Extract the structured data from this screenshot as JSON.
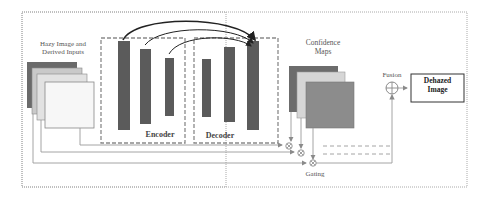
{
  "diagram": {
    "nodes": {
      "inputs_label_line1": "Hazy Image and",
      "inputs_label_line2": "Derived Inputs",
      "encoder_label": "Encoder",
      "decoder_label": "Decoder",
      "confidence_line1": "Confidence",
      "confidence_line2": "Maps",
      "fusion_label": "Fusion",
      "output_line1": "Dehazed",
      "output_line2": "Image",
      "gating_label": "Gating"
    },
    "icons": {
      "fusion": "circle-plus-icon",
      "gating": "circle-times-icon"
    },
    "colors": {
      "bar": "#5b5b5b",
      "line": "#9a9a9a",
      "dashed_box": "#8a8a8a",
      "input_layer_1": "#6a6a6a",
      "input_layer_2": "#c9c9c9",
      "input_layer_3": "#e2e2e2",
      "input_layer_4": "#f7f7f7",
      "conf_layer_1": "#6c6c6c",
      "conf_layer_2": "#d6d6d6",
      "conf_layer_3": "#8c8c8c"
    }
  }
}
